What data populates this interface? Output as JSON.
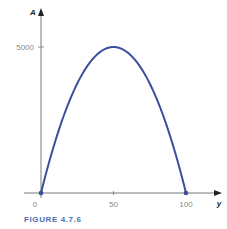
{
  "chart_data": {
    "type": "line",
    "title": "",
    "xlabel": "y",
    "ylabel": "A",
    "xlim": [
      0,
      100
    ],
    "ylim": [
      0,
      5000
    ],
    "x_ticks": [
      "0",
      "50",
      "100"
    ],
    "y_ticks": [
      "5000"
    ],
    "series": [
      {
        "name": "A(y) = y(100 - y) * 2",
        "function": "2*y*(100-y)",
        "x": [
          0,
          10,
          20,
          30,
          40,
          50,
          60,
          70,
          80,
          90,
          100
        ],
        "values": [
          0,
          1800,
          3200,
          4200,
          4800,
          5000,
          4800,
          4200,
          3200,
          1800,
          0
        ],
        "color": "#3b4f9c"
      }
    ],
    "endpoints": [
      [
        0,
        0
      ],
      [
        100,
        0
      ]
    ],
    "grid": false,
    "legend": "none"
  },
  "caption": "FIGURE 4.7.6"
}
